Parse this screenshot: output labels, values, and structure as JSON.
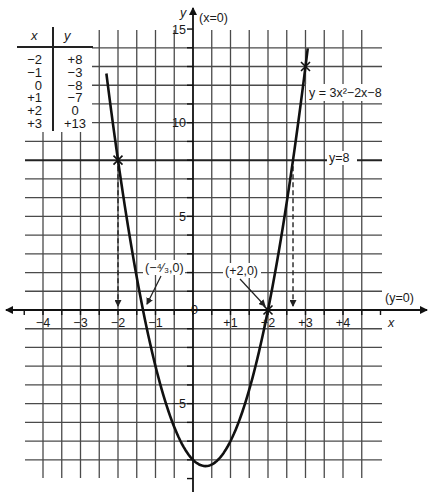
{
  "figure": {
    "table": {
      "headers": [
        "x",
        "y"
      ],
      "rows": [
        [
          "−2",
          "+8"
        ],
        [
          "−1",
          "−3"
        ],
        [
          "0",
          "−8"
        ],
        [
          "+1",
          "−7"
        ],
        [
          "+2",
          "0"
        ],
        [
          "+3",
          "+13"
        ]
      ]
    },
    "axes": {
      "x_label": "x",
      "y_label": "y",
      "x_axis_equation": "(y=0)",
      "y_axis_equation": "(x=0)",
      "origin_label": "0",
      "x_ticks": [
        {
          "value": -4,
          "label": "−4"
        },
        {
          "value": -3,
          "label": "−3"
        },
        {
          "value": -2,
          "label": "−2"
        },
        {
          "value": -1,
          "label": "−1"
        },
        {
          "value": 1,
          "label": "+1"
        },
        {
          "value": 2,
          "label": "+2"
        },
        {
          "value": 3,
          "label": "+3"
        },
        {
          "value": 4,
          "label": "+4"
        }
      ],
      "y_ticks": [
        {
          "value": 15,
          "label": "15"
        },
        {
          "value": 10,
          "label": "10"
        },
        {
          "value": 5,
          "label": "5"
        },
        {
          "value": -5,
          "label": "−5"
        }
      ]
    },
    "annotations": {
      "curve_label": "y = 3x²−2x−8",
      "line_label": "y=8",
      "root_left": "(−⁴⁄₃,0)",
      "root_right": "(+2,0)"
    },
    "colors": {
      "curve": "#111111",
      "grid": "#4a4a4a",
      "axis": "#111111",
      "background": "#ffffff"
    }
  },
  "chart_data": {
    "type": "line",
    "title": "",
    "xlabel": "x",
    "ylabel": "y",
    "function": "y = 3x^2 - 2x - 8",
    "curve": {
      "x_range": [
        -2.31,
        3.06
      ],
      "coefficients": {
        "a": 3,
        "b": -2,
        "c": -8
      }
    },
    "horizontal_line": {
      "y": 8,
      "label": "y=8"
    },
    "table_points": {
      "x": [
        -2,
        -1,
        0,
        1,
        2,
        3
      ],
      "y": [
        8,
        -3,
        -8,
        -7,
        0,
        13
      ]
    },
    "marked_points": [
      {
        "x": -2,
        "y": 8
      },
      {
        "x": 3,
        "y": 13
      },
      {
        "x": 2,
        "y": 0
      }
    ],
    "roots": [
      {
        "x": -1.3333,
        "y": 0,
        "label": "(−4/3,0)"
      },
      {
        "x": 2,
        "y": 0,
        "label": "(+2,0)"
      }
    ],
    "dashed_drops": [
      {
        "x": -2,
        "from_y": 8,
        "to_y": 0
      },
      {
        "x": 2.667,
        "from_y": 8,
        "to_y": 0
      }
    ],
    "xlim": [
      -4.5,
      5
    ],
    "ylim": [
      -9,
      15
    ],
    "x_tick_labels": [
      "−4",
      "−3",
      "−2",
      "−1",
      "+1",
      "+2",
      "+3",
      "+4"
    ],
    "y_tick_labels": [
      "15",
      "10",
      "5",
      "0",
      "−5"
    ],
    "grid": true,
    "grid_x_step": 0.5,
    "grid_y_step": 1
  }
}
